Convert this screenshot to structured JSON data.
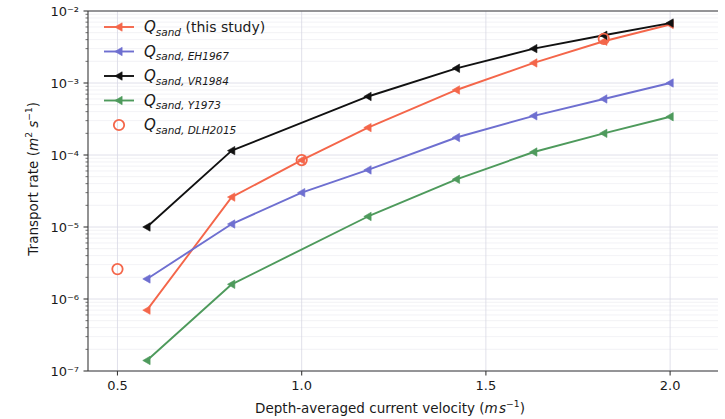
{
  "chart_data": {
    "type": "line",
    "title": "",
    "xlabel": "Depth-averaged current velocity (m s⁻¹)",
    "ylabel": "Transport rate (m² s⁻¹)",
    "xlabel_parts": {
      "text": "Depth-averaged current velocity (",
      "unit_m": "m",
      "unit_s": "s",
      "unit_exp": "-1",
      "close": ")"
    },
    "ylabel_parts": {
      "text": "Transport rate (",
      "unit_m": "m",
      "unit_m_exp": "2",
      "unit_s": "s",
      "unit_s_exp": "-1",
      "close": ")"
    },
    "xlim": [
      0.42,
      2.13
    ],
    "ylim_log": [
      -7,
      -2
    ],
    "xticks": [
      0.5,
      1.0,
      1.5,
      2.0
    ],
    "xticklabels": [
      "0.5",
      "1.0",
      "1.5",
      "2.0"
    ],
    "yticks_exp": [
      -2,
      -3,
      -4,
      -5,
      -6,
      -7
    ],
    "yticklabels": [
      "10⁻²",
      "10⁻³",
      "10⁻⁴",
      "10⁻⁵",
      "10⁻⁶",
      "10⁻⁷"
    ],
    "yscale": "log",
    "grid": true,
    "legend_position": "upper left",
    "series": [
      {
        "name": "Q_sand (this study)",
        "legend_label_base": "Q",
        "legend_sub": "sand",
        "legend_rest": " (this study)",
        "color": "#f4664a",
        "marker": "triangle-left",
        "x": [
          0.58,
          0.81,
          1.0,
          1.18,
          1.42,
          1.63,
          1.82,
          2.0
        ],
        "y": [
          7e-07,
          2.6e-05,
          8.5e-05,
          0.00024,
          0.0008,
          0.0019,
          0.0038,
          0.0065
        ]
      },
      {
        "name": "Q_sand,EH1967",
        "legend_label_base": "Q",
        "legend_sub": "sand, EH1967",
        "legend_rest": "",
        "color": "#6e6fd0",
        "marker": "triangle-left",
        "x": [
          0.58,
          0.81,
          1.0,
          1.18,
          1.42,
          1.63,
          1.82,
          2.0
        ],
        "y": [
          1.9e-06,
          1.1e-05,
          3e-05,
          6.2e-05,
          0.000175,
          0.00035,
          0.0006,
          0.001
        ]
      },
      {
        "name": "Q_sand,VR1984",
        "legend_label_base": "Q",
        "legend_sub": "sand, VR1984",
        "legend_rest": "",
        "color": "#111111",
        "marker": "triangle-left",
        "x": [
          0.58,
          0.81,
          1.18,
          1.42,
          1.63,
          1.82,
          2.0
        ],
        "y": [
          1e-05,
          0.000115,
          0.00065,
          0.0016,
          0.003,
          0.0046,
          0.0068
        ]
      },
      {
        "name": "Q_sand,Y1973",
        "legend_label_base": "Q",
        "legend_sub": "sand, Y1973",
        "legend_rest": "",
        "color": "#4e9a5c",
        "marker": "triangle-left",
        "x": [
          0.58,
          0.81,
          1.18,
          1.42,
          1.63,
          1.82,
          2.0
        ],
        "y": [
          1.4e-07,
          1.6e-06,
          1.4e-05,
          4.6e-05,
          0.00011,
          0.0002,
          0.00034
        ]
      },
      {
        "name": "Q_sand,DLH2015",
        "legend_label_base": "Q",
        "legend_sub": "sand, DLH2015",
        "legend_rest": "",
        "color": "#f4664a",
        "marker": "open-circle",
        "line": false,
        "x": [
          0.5,
          1.0,
          1.82
        ],
        "y": [
          2.6e-06,
          8.5e-05,
          0.0041
        ]
      }
    ]
  },
  "axes": {
    "plot_left": 88,
    "plot_right": 718,
    "plot_top": 11,
    "plot_bottom": 371
  }
}
